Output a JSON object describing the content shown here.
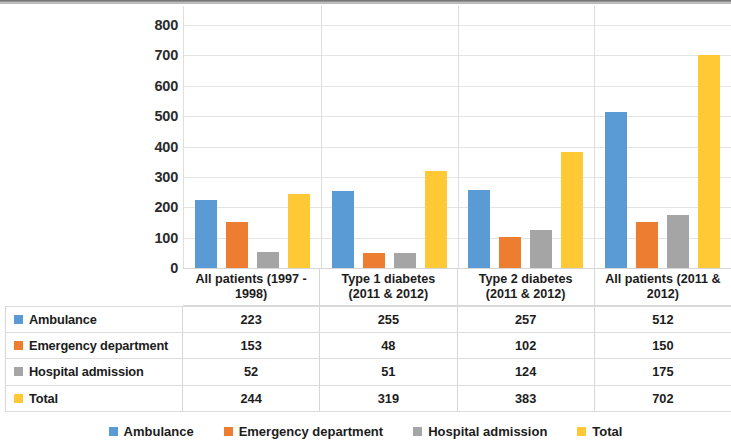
{
  "chart_data": {
    "type": "bar",
    "title": "",
    "subtitle": "",
    "xlabel": "",
    "ylabel": "",
    "ylim": [
      0,
      800
    ],
    "ytick_step": 100,
    "yticks": [
      "800",
      "700",
      "600",
      "500",
      "400",
      "300",
      "200",
      "100",
      "0"
    ],
    "grid": true,
    "legend_position": "bottom",
    "categories": [
      "All patients (1997 - 1998)",
      "Type 1 diabetes (2011 & 2012)",
      "Type 2 diabetes (2011 & 2012)",
      "All patients (2011 & 2012)"
    ],
    "series": [
      {
        "name": "Ambulance",
        "color": "#5b9bd5",
        "values": [
          223,
          255,
          257,
          512
        ]
      },
      {
        "name": "Emergency department",
        "color": "#ed7d31",
        "values": [
          153,
          48,
          102,
          150
        ]
      },
      {
        "name": "Hospital admission",
        "color": "#a5a5a5",
        "values": [
          52,
          51,
          124,
          175
        ]
      },
      {
        "name": "Total",
        "color": "#ffc936",
        "values": [
          244,
          319,
          383,
          702
        ]
      }
    ]
  },
  "category_labels": [
    {
      "line1": "All patients (1997 -",
      "line2": "1998)"
    },
    {
      "line1": "Type 1 diabetes",
      "line2": "(2011 & 2012)"
    },
    {
      "line1": "Type 2 diabetes",
      "line2": "(2011 & 2012)"
    },
    {
      "line1": "All patients (2011 &",
      "line2": "2012)"
    }
  ],
  "data_table": {
    "rows": [
      {
        "label": "Ambulance",
        "color": "#5b9bd5",
        "values": [
          "223",
          "255",
          "257",
          "512"
        ]
      },
      {
        "label": "Emergency department",
        "color": "#ed7d31",
        "values": [
          "153",
          "48",
          "102",
          "150"
        ]
      },
      {
        "label": "Hospital admission",
        "color": "#a5a5a5",
        "values": [
          "52",
          "51",
          "124",
          "175"
        ]
      },
      {
        "label": "Total",
        "color": "#ffc936",
        "values": [
          "244",
          "319",
          "383",
          "702"
        ]
      }
    ]
  },
  "legend": {
    "items": [
      {
        "label": "Ambulance",
        "color": "#5b9bd5"
      },
      {
        "label": "Emergency department",
        "color": "#ed7d31"
      },
      {
        "label": "Hospital admission",
        "color": "#a5a5a5"
      },
      {
        "label": "Total",
        "color": "#ffc936"
      }
    ]
  }
}
